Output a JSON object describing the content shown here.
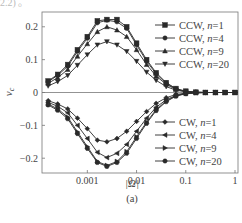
{
  "top_fragment": "2.2) 。",
  "chart_data": {
    "type": "line",
    "title": "",
    "xlabel": "|Ω|",
    "ylabel": "v_c",
    "caption": "(a)",
    "xscale": "log",
    "xlim": [
      0.00012,
      1.15
    ],
    "ylim": [
      -0.245,
      0.245
    ],
    "xticks": [
      0.001,
      0.01,
      0.1,
      1
    ],
    "xtick_labels": [
      "0.001",
      "0.01",
      "0.1",
      "1"
    ],
    "yticks": [
      0.2,
      0.1,
      0,
      -0.1,
      -0.2
    ],
    "ytick_labels": [
      "0.2",
      "0.1",
      "0",
      "−0.1",
      "−0.2"
    ],
    "grid": false,
    "zero_line": true,
    "x": [
      0.00016,
      0.00025,
      0.0004,
      0.00063,
      0.001,
      0.0016,
      0.0025,
      0.004,
      0.0063,
      0.01,
      0.016,
      0.025,
      0.04,
      0.063,
      0.1,
      0.16,
      0.25,
      0.4,
      0.63,
      1.0
    ],
    "series": [
      {
        "name": "CCW, n=1",
        "marker": "square",
        "group": "ccw",
        "values": [
          0.035,
          0.055,
          0.085,
          0.13,
          0.17,
          0.218,
          0.222,
          0.222,
          0.2,
          0.15,
          0.1,
          0.06,
          0.03,
          0.012,
          0.004,
          0.001,
          0.0,
          0.0,
          0.0,
          0.0
        ]
      },
      {
        "name": "CCW, n=4",
        "marker": "circle",
        "group": "ccw",
        "values": [
          0.033,
          0.052,
          0.08,
          0.125,
          0.165,
          0.212,
          0.22,
          0.215,
          0.195,
          0.145,
          0.095,
          0.057,
          0.028,
          0.011,
          0.003,
          0.001,
          0.0,
          0.0,
          0.0,
          0.0
        ]
      },
      {
        "name": "CCW, n=9",
        "marker": "triangle-up",
        "group": "ccw",
        "values": [
          0.028,
          0.045,
          0.07,
          0.11,
          0.148,
          0.185,
          0.2,
          0.19,
          0.17,
          0.13,
          0.085,
          0.05,
          0.025,
          0.009,
          0.003,
          0.001,
          0.0,
          0.0,
          0.0,
          0.0
        ]
      },
      {
        "name": "CCW, n=20",
        "marker": "triangle-down",
        "group": "ccw",
        "values": [
          0.02,
          0.033,
          0.052,
          0.083,
          0.115,
          0.145,
          0.155,
          0.145,
          0.125,
          0.095,
          0.062,
          0.037,
          0.018,
          0.007,
          0.002,
          0.0,
          0.0,
          0.0,
          0.0,
          0.0
        ]
      },
      {
        "name": "CW, n=1",
        "marker": "diamond",
        "group": "cw",
        "values": [
          -0.025,
          -0.035,
          -0.05,
          -0.078,
          -0.11,
          -0.145,
          -0.15,
          -0.14,
          -0.118,
          -0.088,
          -0.058,
          -0.033,
          -0.016,
          -0.006,
          -0.002,
          0.0,
          0.0,
          0.0,
          0.0,
          0.0
        ]
      },
      {
        "name": "CW, n=4",
        "marker": "triangle-left",
        "group": "cw",
        "values": [
          -0.03,
          -0.042,
          -0.062,
          -0.1,
          -0.14,
          -0.182,
          -0.198,
          -0.185,
          -0.158,
          -0.118,
          -0.078,
          -0.045,
          -0.022,
          -0.009,
          -0.003,
          -0.001,
          0.0,
          0.0,
          0.0,
          0.0
        ]
      },
      {
        "name": "CW, n=9",
        "marker": "triangle-right",
        "group": "cw",
        "values": [
          -0.035,
          -0.05,
          -0.075,
          -0.12,
          -0.165,
          -0.21,
          -0.222,
          -0.21,
          -0.18,
          -0.135,
          -0.09,
          -0.052,
          -0.026,
          -0.01,
          -0.003,
          -0.001,
          0.0,
          0.0,
          0.0,
          0.0
        ]
      },
      {
        "name": "CW, n=20",
        "marker": "hexagon",
        "group": "cw",
        "values": [
          -0.038,
          -0.054,
          -0.08,
          -0.125,
          -0.17,
          -0.213,
          -0.225,
          -0.213,
          -0.185,
          -0.14,
          -0.094,
          -0.055,
          -0.028,
          -0.011,
          -0.004,
          -0.001,
          0.0,
          0.0,
          0.0,
          0.0
        ]
      }
    ],
    "legend": [
      {
        "position": "upper-right",
        "entries": [
          "CCW, n=1",
          "CCW, n=4",
          "CCW, n=9",
          "CCW, n=20"
        ]
      },
      {
        "position": "lower-right",
        "entries": [
          "CW, n=1",
          "CW, n=4",
          "CW, n=9",
          "CW, n=20"
        ]
      }
    ],
    "colors": {
      "line": "#2a2a2a",
      "axis": "#777777",
      "text": "#444444"
    }
  }
}
